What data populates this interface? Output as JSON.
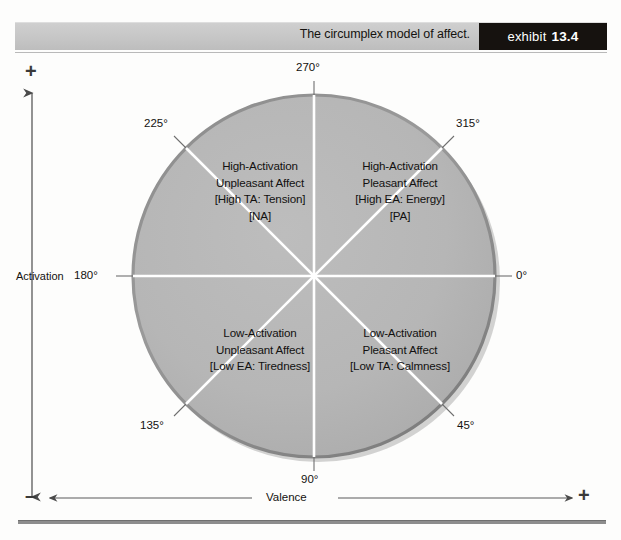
{
  "header": {
    "title": "The circumplex model of affect.",
    "exhibit_word": "exhibit",
    "exhibit_number": "13.4"
  },
  "axes": {
    "vertical_label": "Activation",
    "vertical_plus": "+",
    "vertical_minus": "–",
    "horizontal_label": "Valence",
    "horizontal_plus": "+",
    "horizontal_minus": "–"
  },
  "degrees": {
    "d0": "0°",
    "d45": "45°",
    "d90": "90°",
    "d135": "135°",
    "d180": "180°",
    "d225": "225°",
    "d270": "270°",
    "d315": "315°"
  },
  "quadrants": [
    {
      "id": "high-activation-unpleasant",
      "line1": "High-Activation",
      "line2": "Unpleasant Affect",
      "line3": "[High TA: Tension]",
      "line4": "[NA]"
    },
    {
      "id": "high-activation-pleasant",
      "line1": "High-Activation",
      "line2": "Pleasant Affect",
      "line3": "[High EA: Energy]",
      "line4": "[PA]"
    },
    {
      "id": "low-activation-unpleasant",
      "line1": "Low-Activation",
      "line2": "Unpleasant Affect",
      "line3": "[Low EA: Tiredness]",
      "line4": ""
    },
    {
      "id": "low-activation-pleasant",
      "line1": "Low-Activation",
      "line2": "Pleasant Affect",
      "line3": "[Low TA: Calmness]",
      "line4": ""
    }
  ],
  "colors": {
    "circle_fill": "#b5b5b5",
    "circle_rim": "#8f8f8f",
    "spoke": "#ffffff",
    "badge_bg": "#16120f",
    "header_bar": "#c6c6c6",
    "axis_line": "#5a5a5a"
  }
}
